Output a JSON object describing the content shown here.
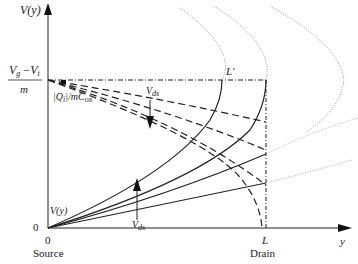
{
  "diagram": {
    "axes": {
      "y_label": "V(y)",
      "x_label": "y",
      "origin_y_tick": "0",
      "origin_x_tick": "0",
      "source_label": "Source",
      "drain_tick": "L",
      "drain_label": "Drain"
    },
    "annotations": {
      "plateau_num_v": "V",
      "plateau_num_g": "g",
      "plateau_num_minus": "−",
      "plateau_num_vt": "V",
      "plateau_num_t": "t",
      "plateau_den": "m",
      "charge_label": "|Q",
      "charge_sub": "i",
      "charge_rest": "|/mC",
      "charge_ox": "ox",
      "pinchoff_label": "L′",
      "vds_top_v": "V",
      "vds_top_sub": "ds",
      "vds_bottom_v": "V",
      "vds_bottom_sub": "ds",
      "vy_curve_label": "V(y)"
    },
    "colors": {
      "line": "#222222",
      "dotted": "#888888"
    }
  }
}
